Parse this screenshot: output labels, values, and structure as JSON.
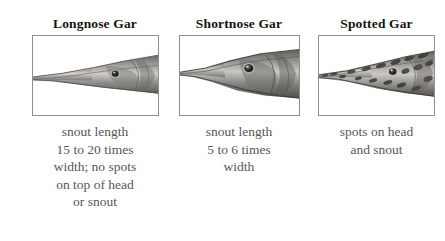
{
  "figure": {
    "type": "comparison-chart",
    "background_color": "#ffffff",
    "title_color": "#17120f",
    "caption_color": "#585558",
    "frame_border_color": "#8f8f8f",
    "panels": [
      {
        "id": "longnose-gar",
        "title": "Longnose Gar",
        "image_name": "longnose-gar-head-photo",
        "image_description": "grayscale photograph of a longnose gar head in profile with a very long slender snout",
        "caption": "snout length\n15 to 20 times\nwidth; no spots\non top of head\nor snout",
        "caption_lines": [
          "snout length",
          "15 to 20 times",
          "width; no spots",
          "on top of head",
          "or snout"
        ]
      },
      {
        "id": "shortnose-gar",
        "title": "Shortnose Gar",
        "image_name": "shortnose-gar-head-photo",
        "image_description": "grayscale photograph of a shortnose gar head in profile with a short broad snout",
        "caption": "snout length\n5 to 6 times\nwidth",
        "caption_lines": [
          "snout length",
          "5 to 6 times",
          "width"
        ]
      },
      {
        "id": "spotted-gar",
        "title": "Spotted Gar",
        "image_name": "spotted-gar-head-photo",
        "image_description": "grayscale photograph of a spotted gar head in profile with dark spots on head and snout",
        "caption": "spots on head\nand snout",
        "caption_lines": [
          "spots on head",
          "and snout"
        ]
      }
    ]
  }
}
